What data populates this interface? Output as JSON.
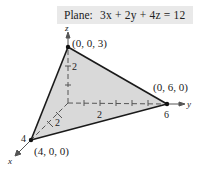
{
  "equation_box": {
    "label": "Plane:",
    "equation": "3x + 2y + 4z = 12"
  },
  "axes": {
    "x_label": "x",
    "y_label": "y",
    "z_label": "z",
    "ticks": {
      "z": [
        "2"
      ],
      "y": [
        "2",
        "6"
      ],
      "x": [
        "2",
        "4"
      ]
    }
  },
  "vertices": [
    {
      "name": "z-intercept",
      "label": "(0, 0, 3)"
    },
    {
      "name": "y-intercept",
      "label": "(0, 6, 0)"
    },
    {
      "name": "x-intercept",
      "label": "(4, 0, 0)"
    }
  ],
  "colors": {
    "plane_fill": "#d9d9d9",
    "edge": "#1a1a1a",
    "axis": "#555555",
    "label_box_bg": "#e9e9e9"
  }
}
